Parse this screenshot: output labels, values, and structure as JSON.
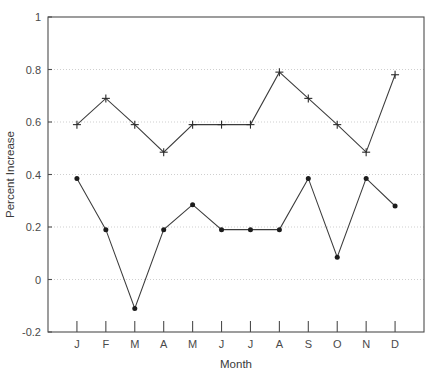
{
  "chart_data": {
    "type": "line",
    "title": "",
    "xlabel": "Month",
    "ylabel": "Percent Increase",
    "categories": [
      "J",
      "F",
      "M",
      "A",
      "M",
      "J",
      "J",
      "A",
      "S",
      "O",
      "N",
      "D"
    ],
    "category_names": [
      "January",
      "February",
      "March",
      "April",
      "May",
      "June",
      "July",
      "August",
      "September",
      "October",
      "November",
      "December"
    ],
    "xlim": [
      0,
      13
    ],
    "ylim": [
      -0.2,
      1
    ],
    "ytick_labels": [
      "1",
      "0.8",
      "0.6",
      "0.4",
      "0.2",
      "0",
      "-0.2"
    ],
    "ytick_values": [
      1,
      0.8,
      0.6,
      0.4,
      0.2,
      0,
      -0.2
    ],
    "grid": "horizontal-dotted",
    "legend": "none",
    "series": [
      {
        "name": "upper-series",
        "marker": "plus",
        "color": "#3c3c3c",
        "values": [
          0.59,
          0.69,
          0.59,
          0.485,
          0.59,
          0.59,
          0.59,
          0.79,
          0.69,
          0.59,
          0.485,
          0.78
        ]
      },
      {
        "name": "lower-series",
        "marker": "dot",
        "color": "#1c1c1c",
        "values": [
          0.385,
          0.19,
          -0.11,
          0.19,
          0.285,
          0.19,
          0.19,
          0.19,
          0.385,
          0.085,
          0.385,
          0.28
        ]
      }
    ]
  },
  "caption": {
    "text": ""
  }
}
